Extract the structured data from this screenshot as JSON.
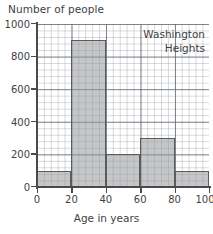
{
  "chart_data": {
    "type": "bar",
    "title": "",
    "xlabel": "Age in years",
    "ylabel": "Number of people",
    "grid": true,
    "legend": "none",
    "bin_width": 20,
    "categories": [
      "0-20",
      "20-40",
      "40-60",
      "60-80",
      "80-100"
    ],
    "bin_edges": [
      0,
      20,
      40,
      60,
      80,
      100
    ],
    "values": [
      100,
      900,
      200,
      300,
      100
    ],
    "xlim": [
      0,
      100
    ],
    "ylim": [
      0,
      1000
    ],
    "xticks": [
      "0",
      "20",
      "40",
      "60",
      "80",
      "100"
    ],
    "yticks": [
      "0",
      "200",
      "400",
      "600",
      "800",
      "1000"
    ],
    "annotations": [
      "Washington",
      "Heights"
    ],
    "colors": {
      "bar_fill": "#96989a",
      "bar_edge": "#5b5b5b",
      "axis": "#4a4a4a",
      "grid_minor": "#788088",
      "grid_major": "#5f6770",
      "text": "#3f3f3f",
      "background": "#ffffff"
    }
  },
  "axis": {
    "y_title": "Number of people",
    "x_title": "Age in years"
  },
  "annotation": {
    "line1": "Washington",
    "line2": "Heights"
  }
}
